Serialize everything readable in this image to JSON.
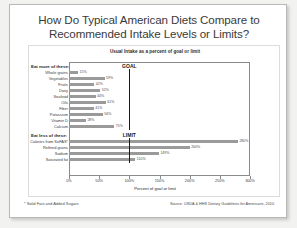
{
  "card": {
    "title": "How Do Typical American Diets Compare to Recommended Intake Levels or Limits?",
    "footnote": "* Solid Fats and Added Sugars",
    "source": "Source: USDA & HHS Dietary Guidelines for Americans, 2010"
  },
  "chart_data": {
    "type": "bar",
    "orientation": "horizontal",
    "title": "Usual Intake as a percent of goal or limit",
    "xlabel": "Percent of goal or limit",
    "ylabel": "",
    "xlim": [
      0,
      300
    ],
    "xticks": [
      0,
      50,
      100,
      150,
      200,
      250,
      300
    ],
    "xtick_labels": [
      "0%",
      "50%",
      "100%",
      "150%",
      "200%",
      "250%",
      "300%"
    ],
    "grid": false,
    "legend": "none",
    "groups": [
      {
        "name": "eat-more",
        "heading": "Eat more of these:",
        "marker_label": "GOAL",
        "marker_value": 100,
        "categories": [
          "Whole grains",
          "Vegetables",
          "Fruits",
          "Dairy",
          "Seafood",
          "Oils",
          "Fiber",
          "Potassium",
          "Vitamin D",
          "Calcium"
        ],
        "values": [
          15,
          59,
          42,
          52,
          44,
          61,
          41,
          56,
          28,
          75
        ],
        "value_labels": [
          "15%",
          "59%",
          "42%",
          "52%",
          "44%",
          "61%",
          "41%",
          "56%",
          "28%",
          "75%"
        ]
      },
      {
        "name": "eat-less",
        "heading": "Eat less of these:",
        "marker_label": "LIMIT",
        "marker_value": 100,
        "categories": [
          "Calories from SoFAS*",
          "Refined grains",
          "Sodium",
          "Saturated fat"
        ],
        "values": [
          280,
          200,
          149,
          110
        ],
        "value_labels": [
          "280%",
          "200%",
          "149%",
          "110%"
        ]
      }
    ]
  }
}
